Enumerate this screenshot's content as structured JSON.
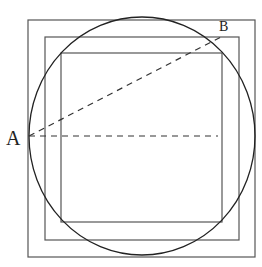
{
  "diagram": {
    "labels": {
      "point_a": "A",
      "point_b": "B"
    },
    "shapes": {
      "outer_square": {
        "x": 28,
        "y": 20,
        "w": 227,
        "h": 237
      },
      "middle_square": {
        "x": 45,
        "y": 37,
        "w": 194,
        "h": 203
      },
      "inner_square": {
        "x": 61,
        "y": 53,
        "w": 161,
        "h": 169
      },
      "circle": {
        "cx": 142,
        "cy": 136,
        "rx": 113,
        "ry": 119
      },
      "dashed_line_ab": {
        "x1": 29,
        "y1": 136,
        "x2": 221,
        "y2": 37
      },
      "dashed_line_horizontal": {
        "x1": 29,
        "y1": 136,
        "x2": 218,
        "y2": 136
      }
    },
    "colors": {
      "stroke": "#333333",
      "square_stroke": "#555555"
    }
  }
}
